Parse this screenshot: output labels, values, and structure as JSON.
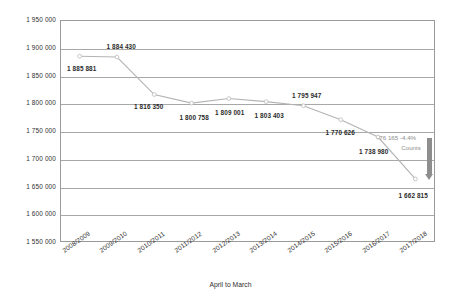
{
  "chart_data": {
    "type": "line",
    "title": "",
    "xlabel": "April to March",
    "ylabel": "",
    "categories": [
      "2008/2009",
      "2009/2010",
      "2010/2011",
      "2011/2012",
      "2012/2013",
      "2013/2014",
      "2014/2015",
      "2015/2016",
      "2016/2017",
      "2017/2018"
    ],
    "values": [
      1885881,
      1884430,
      1816350,
      1800758,
      1809001,
      1803403,
      1795947,
      1770626,
      1738980,
      1662815
    ],
    "data_labels": [
      "1 885 881",
      "1 884 430",
      "1 816 350",
      "1 800 758",
      "1 809 001",
      "1 803 403",
      "1 795 947",
      "1 770 626",
      "1 738 980",
      "1 662 815"
    ],
    "ylim": [
      1550000,
      1950000
    ],
    "ytick_step": 50000,
    "ytick_labels": [
      "1 950 000",
      "1 900 000",
      "1 850 000",
      "1 800 000",
      "1 750 000",
      "1 700 000",
      "1 650 000",
      "1 600 000",
      "1 550 000"
    ],
    "grid": true,
    "legend": "none",
    "series_color": "#b3b3b3",
    "marker_color": "#c0c0c0",
    "annotation": {
      "delta_value": "-76 165",
      "delta_percent": "-4.4%",
      "caption": "Counts",
      "color": "#8e8e8e",
      "from_value": 1738980,
      "to_value": 1662815
    }
  }
}
